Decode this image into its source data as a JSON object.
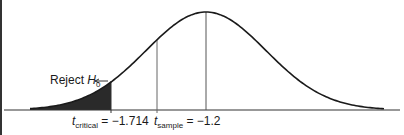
{
  "chart_data": {
    "type": "line",
    "title": "",
    "xlabel": "",
    "ylabel": "",
    "grid": false,
    "series": [
      {
        "name": "t-distribution density",
        "shape": "bell curve"
      }
    ],
    "annotations": [
      {
        "type": "shaded-region",
        "label": "Reject H0",
        "from": "-inf",
        "to": -1.714
      },
      {
        "type": "vline",
        "label": "t_critical = -1.714",
        "x": -1.714
      },
      {
        "type": "vline",
        "label": "t_sample = -1.2",
        "x": -1.2
      },
      {
        "type": "vline",
        "label": "center",
        "x": 0
      }
    ]
  },
  "labels": {
    "reject_text": "Reject ",
    "reject_var": "H",
    "reject_sub": "0",
    "arrow": "←",
    "critical_var": "t",
    "critical_sub": "critical",
    "critical_value": " = −1.714",
    "sample_var": "t",
    "sample_sub": "sample",
    "sample_value": " = −1.2"
  },
  "colors": {
    "curve": "#1a1a1a",
    "shade": "#2a2a2a",
    "vline": "#555555"
  }
}
